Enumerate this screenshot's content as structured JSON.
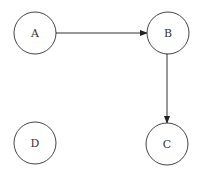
{
  "nodes": [
    {
      "id": "A",
      "label": "A",
      "cx": 35,
      "cy": 33
    },
    {
      "id": "B",
      "label": "B",
      "cx": 168,
      "cy": 33
    },
    {
      "id": "C",
      "label": "C",
      "cx": 167,
      "cy": 144
    },
    {
      "id": "D",
      "label": "D",
      "cx": 35,
      "cy": 143
    }
  ],
  "edges": [
    {
      "from": "A",
      "to": "B",
      "bidirectional": true
    },
    {
      "from": "B",
      "to": "C",
      "bidirectional": true
    }
  ],
  "colors": {
    "stroke": "#333333",
    "background": "#ffffff"
  }
}
